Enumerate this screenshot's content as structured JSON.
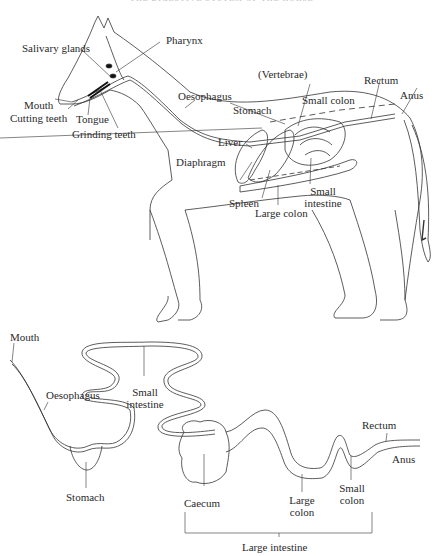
{
  "header": {
    "text": "THE DIGESTIVE SYSTEM OF THE HORSE"
  },
  "top_diagram": {
    "labels": {
      "salivary_glands": "Salivary glands",
      "pharynx": "Pharynx",
      "mouth": "Mouth",
      "cutting_teeth": "Cutting teeth",
      "tongue": "Tongue",
      "grinding_teeth": "Grinding teeth",
      "oesophagus": "Oesophagus",
      "vertebrae": "(Vertebrae)",
      "rectum": "Rectum",
      "anus": "Anus",
      "small_colon": "Small colon",
      "stomach": "Stomach",
      "liver": "Liver",
      "diaphragm": "Diaphragm",
      "spleen": "Spleen",
      "large_colon": "Large colon",
      "small_intestine_1": "Small",
      "small_intestine_2": "intestine"
    }
  },
  "bottom_diagram": {
    "labels": {
      "mouth": "Mouth",
      "oesophagus": "Oesophagus",
      "small_intestine_1": "Small",
      "small_intestine_2": "intestine",
      "stomach": "Stomach",
      "caecum": "Caecum",
      "large_colon_1": "Large",
      "large_colon_2": "colon",
      "small_colon_1": "Small",
      "small_colon_2": "colon",
      "rectum": "Rectum",
      "anus": "Anus",
      "large_intestine": "Large intestine"
    }
  }
}
